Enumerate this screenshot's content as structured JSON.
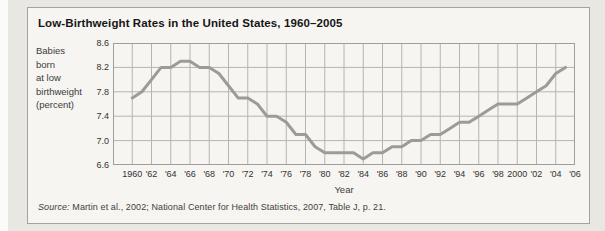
{
  "figure": {
    "title": "Low-Birthweight Rates in the United States, 1960–2005",
    "y_axis_label_lines": [
      "Babies",
      "born",
      "at low",
      "birthweight",
      "(percent)"
    ],
    "x_axis_label": "Year",
    "source_prefix": "Source:",
    "source_text": " Martin et al., 2002; National Center for Health Statistics, 2007, Table J, p. 21."
  },
  "chart_data": {
    "type": "line",
    "title": "Low-Birthweight Rates in the United States, 1960–2005",
    "xlabel": "Year",
    "ylabel": "Babies born at low birthweight (percent)",
    "x_range": [
      1958,
      2006
    ],
    "y_range": [
      6.6,
      8.6
    ],
    "grid": true,
    "legend": "none",
    "y_tick_labels": [
      "8.6",
      "8.2",
      "7.8",
      "7.4",
      "7.0",
      "6.6"
    ],
    "y_tick_values": [
      8.6,
      8.2,
      7.8,
      7.4,
      7.0,
      6.6
    ],
    "x_tick_labels": [
      "1960",
      "'62",
      "'64",
      "'66",
      "'68",
      "'70",
      "'72",
      "'74",
      "'76",
      "'78",
      "'80",
      "'82",
      "'84",
      "'86",
      "'88",
      "'90",
      "'92",
      "'94",
      "'96",
      "'98",
      "2000",
      "'02",
      "'04",
      "'06"
    ],
    "x_tick_values": [
      1960,
      1962,
      1964,
      1966,
      1968,
      1970,
      1972,
      1974,
      1976,
      1978,
      1980,
      1982,
      1984,
      1986,
      1988,
      1990,
      1992,
      1994,
      1996,
      1998,
      2000,
      2002,
      2004,
      2006
    ],
    "gridline_step_x_years": 2,
    "series": [
      {
        "name": "Percent of babies born at low birthweight",
        "x": [
          1960,
          1961,
          1962,
          1963,
          1964,
          1965,
          1966,
          1967,
          1968,
          1969,
          1970,
          1971,
          1972,
          1973,
          1974,
          1975,
          1976,
          1977,
          1978,
          1979,
          1980,
          1981,
          1982,
          1983,
          1984,
          1985,
          1986,
          1987,
          1988,
          1989,
          1990,
          1991,
          1992,
          1993,
          1994,
          1995,
          1996,
          1997,
          1998,
          1999,
          2000,
          2001,
          2002,
          2003,
          2004,
          2005
        ],
        "y": [
          7.7,
          7.8,
          8.0,
          8.2,
          8.2,
          8.3,
          8.3,
          8.2,
          8.2,
          8.1,
          7.9,
          7.7,
          7.7,
          7.6,
          7.4,
          7.4,
          7.3,
          7.1,
          7.1,
          6.9,
          6.8,
          6.8,
          6.8,
          6.8,
          6.7,
          6.8,
          6.8,
          6.9,
          6.9,
          7.0,
          7.0,
          7.1,
          7.1,
          7.2,
          7.3,
          7.3,
          7.4,
          7.5,
          7.6,
          7.6,
          7.6,
          7.7,
          7.8,
          7.9,
          8.1,
          8.2
        ]
      }
    ],
    "colors": {
      "line": "#9b9b98",
      "grid": "#b6b4b0",
      "frame": "#a09e9a",
      "plot_background": "#f6f5f1",
      "figure_background": "#f6f5f1",
      "page_background": "#e9e7e2",
      "title_text": "#161616",
      "tick_text": "#333333"
    }
  }
}
